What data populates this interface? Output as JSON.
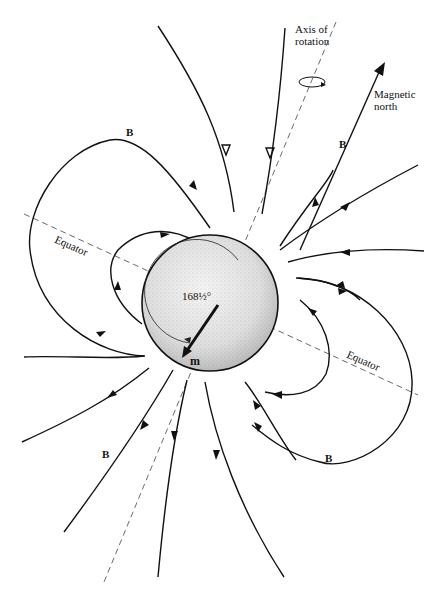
{
  "diagram": {
    "labels": {
      "axis_of_rotation_line1": "Axis of",
      "axis_of_rotation_line2": "rotation",
      "magnetic_north_line1": "Magnetic",
      "magnetic_north_line2": "north",
      "equator_left": "Equator",
      "equator_right": "Equator",
      "angle": "168½°",
      "moment": "m",
      "field_B": "B"
    },
    "field_label_count": 4,
    "colors": {
      "line": "#111111",
      "sphere_fill": "#e4e4e4",
      "dashed": "#444444",
      "background": "#ffffff"
    }
  }
}
